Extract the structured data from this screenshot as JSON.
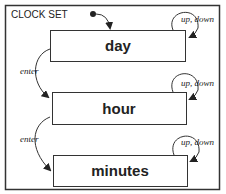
{
  "diagram": {
    "title": "CLOCK SET",
    "states": [
      {
        "label": "day"
      },
      {
        "label": "hour"
      },
      {
        "label": "minutes"
      }
    ],
    "transitions": [
      {
        "label": "up, down",
        "from": "day",
        "to": "day"
      },
      {
        "label": "enter",
        "from": "day",
        "to": "hour"
      },
      {
        "label": "up, down",
        "from": "hour",
        "to": "hour"
      },
      {
        "label": "enter",
        "from": "hour",
        "to": "minutes"
      },
      {
        "label": "up, down",
        "from": "minutes",
        "to": "minutes"
      }
    ],
    "colors": {
      "stroke": "#333333",
      "background": "#ffffff"
    }
  }
}
